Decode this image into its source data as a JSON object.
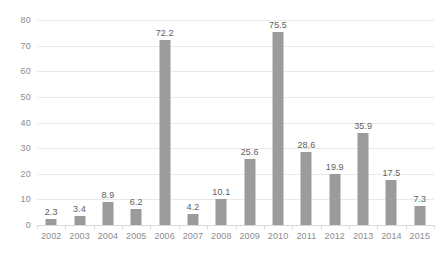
{
  "chart_data": {
    "type": "bar",
    "title": "",
    "subtitle": "",
    "xlabel": "",
    "ylabel": "",
    "categories": [
      "2002",
      "2003",
      "2004",
      "2005",
      "2006",
      "2007",
      "2008",
      "2009",
      "2010",
      "2011",
      "2012",
      "2013",
      "2014",
      "2015"
    ],
    "values": [
      2.3,
      3.4,
      8.9,
      6.2,
      72.2,
      4.2,
      10.1,
      25.6,
      75.5,
      28.6,
      19.9,
      35.9,
      17.5,
      7.3
    ],
    "data_labels": [
      "2.3",
      "3.4",
      "8.9",
      "6.2",
      "72.2",
      "4.2",
      "10.1",
      "25.6",
      "75.5",
      "28.6",
      "19.9",
      "35.9",
      "17.5",
      "7.3"
    ],
    "ylim": [
      0,
      80
    ],
    "ytick_step": 10,
    "ytick_labels": [
      "0",
      "10",
      "20",
      "30",
      "40",
      "50",
      "60",
      "70",
      "80"
    ],
    "ytick_values": [
      0,
      10,
      20,
      30,
      40,
      50,
      60,
      70,
      80
    ],
    "grid": "horizontal",
    "legend": "none",
    "series": [
      {
        "name": "",
        "values": [
          2.3,
          3.4,
          8.9,
          6.2,
          72.2,
          4.2,
          10.1,
          25.6,
          75.5,
          28.6,
          19.9,
          35.9,
          17.5,
          7.3
        ]
      }
    ],
    "colors": {
      "bar": "#9b9b9b",
      "gridline": "#e9e9e9",
      "axis_line": "#d9d9d9",
      "tick_label": "#8c8c8c",
      "data_label": "#5e5e5e",
      "background": "#ffffff"
    }
  }
}
